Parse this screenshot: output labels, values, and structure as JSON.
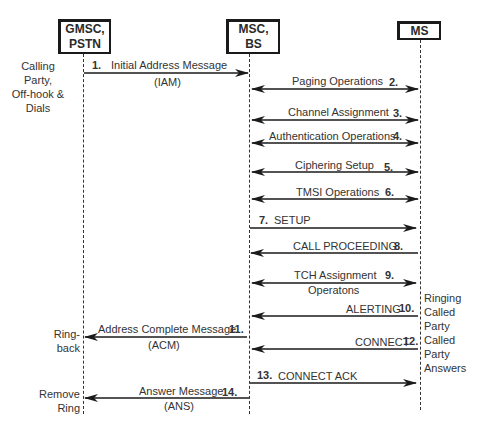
{
  "entities": [
    {
      "id": "gmsc",
      "label_line1": "GMSC,",
      "label_line2": "PSTN"
    },
    {
      "id": "msc",
      "label_line1": "MSC,",
      "label_line2": "BS"
    },
    {
      "id": "ms",
      "label_line1": "MS",
      "label_line2": ""
    }
  ],
  "side_notes": {
    "calling_party": [
      "Calling",
      "Party,",
      "Off-hook &",
      "Dials"
    ],
    "ring_back": [
      "Ring-",
      "back"
    ],
    "remove_ring": [
      "Remove",
      "Ring"
    ],
    "ringing_called_party": [
      "Ringing",
      "Called",
      "Party"
    ],
    "called_party_answers": [
      "Called",
      "Party",
      "Answers"
    ]
  },
  "messages": [
    {
      "num": "1.",
      "label": "Initial Address Message",
      "sublabel": "(IAM)",
      "from": "gmsc",
      "to": "msc",
      "direction": "right"
    },
    {
      "num": "2.",
      "label": "Paging Operations",
      "sublabel": "",
      "from": "msc",
      "to": "ms",
      "direction": "both"
    },
    {
      "num": "3.",
      "label": "Channel Assignment",
      "sublabel": "",
      "from": "msc",
      "to": "ms",
      "direction": "both"
    },
    {
      "num": "4.",
      "label": "Authentication Operations",
      "sublabel": "",
      "from": "msc",
      "to": "ms",
      "direction": "both"
    },
    {
      "num": "5.",
      "label": "Ciphering Setup",
      "sublabel": "",
      "from": "msc",
      "to": "ms",
      "direction": "both"
    },
    {
      "num": "6.",
      "label": "TMSI Operations",
      "sublabel": "",
      "from": "msc",
      "to": "ms",
      "direction": "both"
    },
    {
      "num": "7.",
      "label": "SETUP",
      "sublabel": "",
      "from": "msc",
      "to": "ms",
      "direction": "right"
    },
    {
      "num": "8.",
      "label": "CALL PROCEEDING",
      "sublabel": "",
      "from": "ms",
      "to": "msc",
      "direction": "left"
    },
    {
      "num": "9.",
      "label": "TCH Assignment",
      "sublabel": "Operatons",
      "from": "msc",
      "to": "ms",
      "direction": "both"
    },
    {
      "num": "10.",
      "label": "ALERTING",
      "sublabel": "",
      "from": "ms",
      "to": "msc",
      "direction": "left"
    },
    {
      "num": "11.",
      "label": "Address Complete Message",
      "sublabel": "(ACM)",
      "from": "msc",
      "to": "gmsc",
      "direction": "left"
    },
    {
      "num": "12.",
      "label": "CONNECT",
      "sublabel": "",
      "from": "ms",
      "to": "msc",
      "direction": "left"
    },
    {
      "num": "13.",
      "label": "CONNECT ACK",
      "sublabel": "",
      "from": "msc",
      "to": "ms",
      "direction": "right"
    },
    {
      "num": "14.",
      "label": "Answer Message",
      "sublabel": "(ANS)",
      "from": "msc",
      "to": "gmsc",
      "direction": "left"
    }
  ]
}
